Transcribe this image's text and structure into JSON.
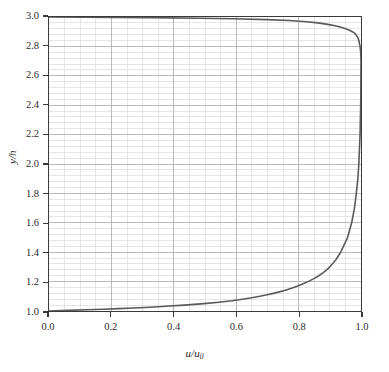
{
  "chart_data": {
    "type": "line",
    "title": "",
    "subtitle": "",
    "xlabel": "u/u0",
    "xlabel_parts": {
      "numerator": "u",
      "slash": "/",
      "denominator": "u",
      "subscript": "0"
    },
    "ylabel": "y/h",
    "ylabel_parts": {
      "numerator": "y",
      "slash": "/",
      "denominator": "h"
    },
    "xlim": [
      0.0,
      1.0
    ],
    "ylim": [
      1.0,
      3.0
    ],
    "x_major_ticks": [
      0.0,
      0.2,
      0.4,
      0.6,
      0.8,
      1.0
    ],
    "x_tick_labels": [
      "0.0",
      "0.2",
      "0.4",
      "0.6",
      "0.8",
      "1.0"
    ],
    "y_major_ticks": [
      1.0,
      1.2,
      1.4,
      1.6,
      1.8,
      2.0,
      2.2,
      2.4,
      2.6,
      2.8,
      3.0
    ],
    "y_tick_labels": [
      "1.0",
      "1.2",
      "1.4",
      "1.6",
      "1.8",
      "2.0",
      "2.2",
      "2.4",
      "2.6",
      "2.8",
      "3.0"
    ],
    "x_minor_step": 0.05,
    "y_minor_step": 0.04,
    "grid": true,
    "grid_major_color": "#b9b9b9",
    "grid_minor_color": "#dedede",
    "legend": null,
    "legend_position": "none",
    "annotations": [],
    "line_color": "#5a5a5a",
    "line_width": 1.6,
    "series": [
      {
        "name": "u/u0 profile",
        "orientation": "x-vs-y",
        "y": [
          1.0,
          1.004,
          1.008,
          1.012,
          1.016,
          1.02,
          1.026,
          1.032,
          1.04,
          1.05,
          1.06,
          1.07,
          1.08,
          1.09,
          1.1,
          1.11,
          1.12,
          1.13,
          1.14,
          1.15,
          1.16,
          1.17,
          1.18,
          1.19,
          1.2,
          1.22,
          1.24,
          1.26,
          1.28,
          1.3,
          1.35,
          1.4,
          1.5,
          1.6,
          1.7,
          1.8,
          1.9,
          2.0,
          2.1,
          2.2,
          2.3,
          2.4,
          2.5,
          2.6,
          2.65,
          2.7,
          2.72,
          2.74,
          2.76,
          2.78,
          2.8,
          2.82,
          2.84,
          2.86,
          2.87,
          2.88,
          2.89,
          2.9,
          2.91,
          2.92,
          2.93,
          2.94,
          2.95,
          2.96,
          2.968,
          2.976,
          2.982,
          2.988,
          2.992,
          2.996,
          3.0
        ],
        "x": [
          0.0,
          0.062,
          0.12,
          0.174,
          0.224,
          0.27,
          0.325,
          0.374,
          0.434,
          0.496,
          0.545,
          0.586,
          0.62,
          0.65,
          0.676,
          0.699,
          0.719,
          0.738,
          0.755,
          0.77,
          0.784,
          0.797,
          0.809,
          0.82,
          0.83,
          0.849,
          0.865,
          0.878,
          0.89,
          0.9,
          0.92,
          0.935,
          0.957,
          0.97,
          0.979,
          0.985,
          0.99,
          0.993,
          0.995,
          0.997,
          0.998,
          0.999,
          0.9995,
          0.9998,
          0.9999,
          1.0,
          0.9998,
          0.9995,
          0.999,
          0.998,
          0.997,
          0.995,
          0.993,
          0.99,
          0.987,
          0.984,
          0.979,
          0.972,
          0.963,
          0.951,
          0.936,
          0.917,
          0.893,
          0.862,
          0.826,
          0.77,
          0.7,
          0.59,
          0.48,
          0.32,
          0.0
        ]
      }
    ]
  },
  "figure": {
    "background_color": "#ffffff",
    "axis_color": "#3a3a3a"
  }
}
